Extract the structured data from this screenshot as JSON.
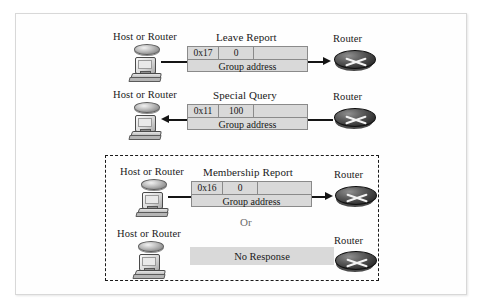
{
  "labels": {
    "host": "Host or Router",
    "router": "Router",
    "or": "Or",
    "group_address": "Group address",
    "no_response": "No Response"
  },
  "rows": [
    {
      "id": "leave-report",
      "title": "Leave Report",
      "left_label": "Host or Router",
      "right_label": "Router",
      "type_field": "0x17",
      "second_field": "0",
      "payload": "Group address",
      "direction": "right"
    },
    {
      "id": "special-query",
      "title": "Special Query",
      "left_label": "Host or Router",
      "right_label": "Router",
      "type_field": "0x11",
      "second_field": "100",
      "payload": "Group address",
      "direction": "left"
    },
    {
      "id": "membership-report",
      "title": "Membership Report",
      "left_label": "Host or Router",
      "right_label": "Router",
      "type_field": "0x16",
      "second_field": "0",
      "payload": "Group address",
      "direction": "right"
    },
    {
      "id": "no-response",
      "title": "",
      "left_label": "Host or Router",
      "right_label": "Router",
      "bar_text": "No Response",
      "direction": "none"
    }
  ],
  "icons": {
    "host": "host-computer-icon",
    "router": "router-puck-icon",
    "arrow_right": "arrow-right-icon",
    "arrow_left": "arrow-left-icon"
  },
  "colors": {
    "packet_fill": "#d9d9d9",
    "packet_border": "#8a8a8a",
    "line": "#151515",
    "dashed_border": "#1a1a1a",
    "frame_border": "#d8d8d8",
    "or_text": "#6d6d6d"
  }
}
